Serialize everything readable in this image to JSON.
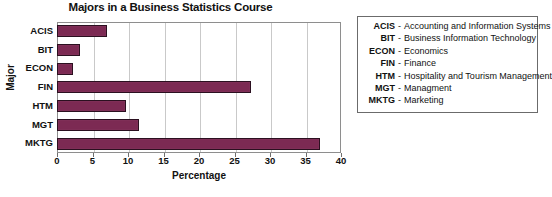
{
  "chart_data": {
    "type": "bar",
    "orientation": "horizontal",
    "title": "Majors in a Business Statistics Course",
    "xlabel": "Percentage",
    "ylabel": "Major",
    "categories": [
      "ACIS",
      "BIT",
      "ECON",
      "FIN",
      "HTM",
      "MGT",
      "MKTG"
    ],
    "values": [
      7.0,
      3.2,
      2.3,
      27.3,
      9.7,
      11.5,
      37.0
    ],
    "xlim": [
      0,
      40
    ],
    "xticks": [
      0,
      5,
      10,
      15,
      20,
      25,
      30,
      35,
      40
    ],
    "xticklabels": [
      "0",
      "5",
      "10",
      "15",
      "20",
      "25",
      "30",
      "35",
      "40"
    ],
    "grid": "vertical",
    "bar_color": "#7c2a53",
    "bar_edge_color": "#2b1020",
    "legend_position": "outside-right"
  },
  "legend": {
    "entries": [
      {
        "abbr": "ACIS",
        "dash": "-",
        "desc": "Accounting and Information Systems"
      },
      {
        "abbr": "BIT",
        "dash": "-",
        "desc": "Business Information Technology"
      },
      {
        "abbr": "ECON",
        "dash": "-",
        "desc": "Economics"
      },
      {
        "abbr": "FIN",
        "dash": "-",
        "desc": "Finance"
      },
      {
        "abbr": "HTM",
        "dash": "-",
        "desc": "Hospitality and Tourism Management"
      },
      {
        "abbr": "MGT",
        "dash": "-",
        "desc": "Managment"
      },
      {
        "abbr": "MKTG",
        "dash": "-",
        "desc": "Marketing"
      }
    ]
  }
}
